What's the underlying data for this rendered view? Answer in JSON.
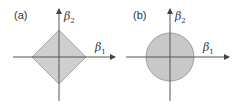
{
  "panels": [
    {
      "label": "(a)",
      "shape": "diamond",
      "x_axis_label": "β",
      "x_axis_sub": "1",
      "y_axis_label": "β",
      "y_axis_sub": "2"
    },
    {
      "label": "(b)",
      "shape": "circle",
      "x_axis_label": "β",
      "x_axis_sub": "1",
      "y_axis_label": "β",
      "y_axis_sub": "2"
    }
  ],
  "colors": {
    "fill": "#c8c8c8",
    "stroke": "#9a9a9a",
    "axis": "#444444"
  }
}
